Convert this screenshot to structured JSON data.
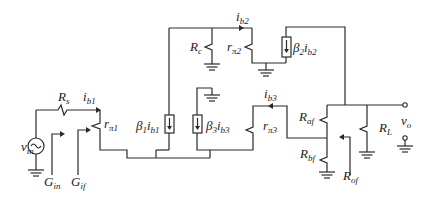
{
  "diagram": {
    "type": "small-signal feedback amplifier circuit",
    "colors": {
      "wire": "#2a2a2a",
      "text": "#1a1a1a",
      "background": "#ffffff"
    },
    "labels": {
      "vin": {
        "base": "v",
        "sub": "in"
      },
      "Rs": {
        "base": "R",
        "sub": "s"
      },
      "ib1": {
        "base": "i",
        "sub": "b1"
      },
      "rpi1": {
        "base": "r",
        "sub": "π1"
      },
      "Gin": {
        "base": "G",
        "sub": "in"
      },
      "Gif": {
        "base": "G",
        "sub": "if"
      },
      "beta1": {
        "base": "β",
        "sub1": "1",
        "mid": "i",
        "sub2": "b1"
      },
      "beta3": {
        "base": "β",
        "sub1": "3",
        "mid": "i",
        "sub2": "b3"
      },
      "beta2": {
        "base": "β",
        "sub1": "2",
        "mid": "i",
        "sub2": "b2"
      },
      "Rc": {
        "base": "R",
        "sub": "c"
      },
      "ib2": {
        "base": "i",
        "sub": "b2"
      },
      "rpi2": {
        "base": "r",
        "sub": "π2"
      },
      "ib3": {
        "base": "i",
        "sub": "b3"
      },
      "rpi3": {
        "base": "r",
        "sub": "π3"
      },
      "Raf": {
        "base": "R",
        "sub": "af"
      },
      "Rbf": {
        "base": "R",
        "sub": "bf"
      },
      "Rof": {
        "base": "R",
        "sub": "of"
      },
      "RL": {
        "base": "R",
        "sub": "L"
      },
      "vo": {
        "base": "v",
        "sub": "o"
      }
    },
    "components": [
      {
        "id": "vin",
        "kind": "ac-voltage-source"
      },
      {
        "id": "Rs",
        "kind": "resistor"
      },
      {
        "id": "rpi1",
        "kind": "resistor"
      },
      {
        "id": "beta1",
        "kind": "current-source"
      },
      {
        "id": "beta3",
        "kind": "current-source"
      },
      {
        "id": "Rc",
        "kind": "resistor"
      },
      {
        "id": "rpi2",
        "kind": "resistor"
      },
      {
        "id": "beta2",
        "kind": "current-source"
      },
      {
        "id": "rpi3",
        "kind": "resistor"
      },
      {
        "id": "Raf",
        "kind": "resistor"
      },
      {
        "id": "Rbf",
        "kind": "resistor"
      },
      {
        "id": "RL",
        "kind": "resistor"
      }
    ]
  }
}
